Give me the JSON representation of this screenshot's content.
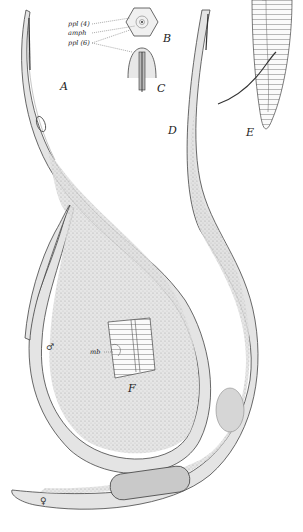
{
  "figure": {
    "panels": [
      {
        "id": "A",
        "label": "A",
        "description": "anterior region of male"
      },
      {
        "id": "B",
        "label": "B",
        "description": "en face view of head"
      },
      {
        "id": "C",
        "label": "C",
        "description": "head, lateral"
      },
      {
        "id": "D",
        "label": "D",
        "description": "anterior region of female"
      },
      {
        "id": "E",
        "label": "E",
        "description": "male tail with spicule"
      },
      {
        "id": "F",
        "label": "F",
        "description": "cuticle detail with mb"
      }
    ],
    "annotations": {
      "ppl4": "ppl (4)",
      "amph": "amph",
      "ppl6": "ppl (6)",
      "mb": "mb"
    },
    "sex_symbols": {
      "male": "♂",
      "female": "♀"
    }
  }
}
